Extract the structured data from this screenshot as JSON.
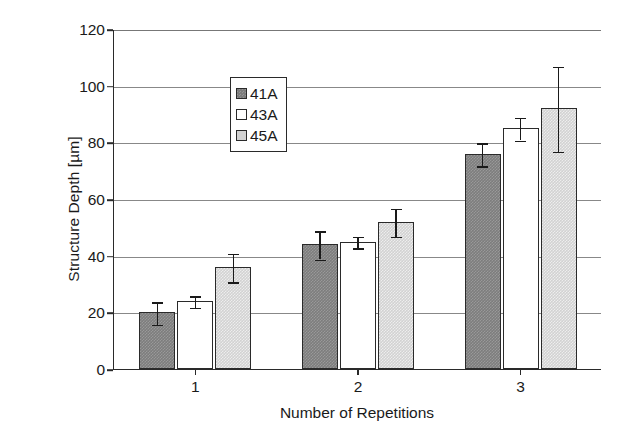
{
  "chart_data": {
    "type": "bar",
    "title": "",
    "xlabel": "Number of Repetitions",
    "ylabel": "Structure Depth [µm]",
    "categories": [
      "1",
      "2",
      "3"
    ],
    "ylim": [
      0,
      120
    ],
    "yticks": [
      0,
      20,
      40,
      60,
      80,
      100,
      120
    ],
    "ytick_labels": [
      "0",
      "20",
      "40",
      "60",
      "80",
      "100",
      "120"
    ],
    "grid": true,
    "grid_axis": "y",
    "legend_position": "upper left",
    "series": [
      {
        "name": "41A",
        "color": "#7d7d7d",
        "values": [
          20,
          44,
          76
        ],
        "errors": [
          4,
          5,
          4
        ]
      },
      {
        "name": "43A",
        "color": "#ffffff",
        "values": [
          24,
          45,
          85
        ],
        "errors": [
          2,
          2,
          4
        ]
      },
      {
        "name": "45A",
        "color": "#d2d2d2",
        "values": [
          36,
          52,
          92
        ],
        "errors": [
          5,
          5,
          15
        ]
      }
    ]
  },
  "legend": {
    "entries": [
      {
        "label": "41A"
      },
      {
        "label": "43A"
      },
      {
        "label": "45A"
      }
    ]
  }
}
